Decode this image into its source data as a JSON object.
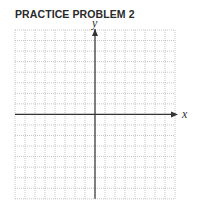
{
  "heading": "PRACTICE PROBLEM 2",
  "graph": {
    "x_axis_label": "x",
    "y_axis_label": "y",
    "grid": {
      "columns": 16,
      "rows": 16,
      "left": 15,
      "top": 30,
      "cell_width": 10,
      "cell_height": 10.55,
      "line_color": "#b8b8b8",
      "line_style": "dotted"
    },
    "axis_color": "#333333",
    "origin": {
      "col": 8,
      "row": 8
    }
  }
}
